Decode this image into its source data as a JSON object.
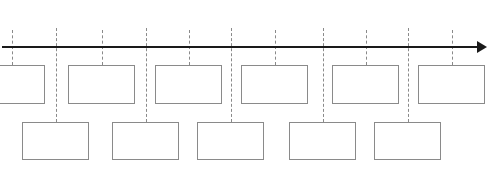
{
  "diagram": {
    "type": "timeline-template",
    "colors": {
      "axis": "#1a1a1a",
      "box_border": "#8a8a8a",
      "connector": "#8a8a8a",
      "background": "#ffffff"
    },
    "axis": {
      "y": 47,
      "x_start": 2,
      "x_end": 487,
      "direction": "right",
      "label": ""
    },
    "top_row": {
      "box_top": 65,
      "box_height": 39,
      "connector_top": 30,
      "boxes": [
        {
          "x": -22,
          "width": 67,
          "label": ""
        },
        {
          "x": 68,
          "width": 67,
          "label": ""
        },
        {
          "x": 155,
          "width": 67,
          "label": ""
        },
        {
          "x": 241,
          "width": 67,
          "label": ""
        },
        {
          "x": 332,
          "width": 67,
          "label": ""
        },
        {
          "x": 418,
          "width": 67,
          "label": ""
        }
      ]
    },
    "bottom_row": {
      "box_top": 122,
      "box_height": 38,
      "connector_top": 28,
      "boxes": [
        {
          "x": 22,
          "width": 67,
          "label": ""
        },
        {
          "x": 112,
          "width": 67,
          "label": ""
        },
        {
          "x": 197,
          "width": 67,
          "label": ""
        },
        {
          "x": 289,
          "width": 67,
          "label": ""
        },
        {
          "x": 374,
          "width": 67,
          "label": ""
        }
      ]
    }
  }
}
